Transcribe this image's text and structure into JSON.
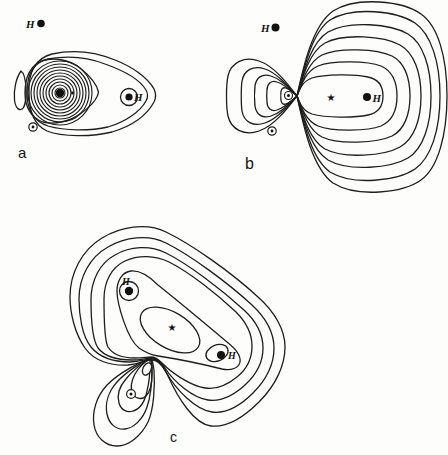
{
  "colors": {
    "background": "#fdfdfb",
    "contour_line": "#1d1d1d",
    "text": "#141414"
  },
  "panels": {
    "a": {
      "label": "a",
      "free_hydrogen_label": "H",
      "bonded_hydrogen_label": "H"
    },
    "b": {
      "label": "b",
      "free_hydrogen_label": "H",
      "bonded_hydrogen_label": "H",
      "centroid_star": "★"
    },
    "c": {
      "label": "c",
      "hydrogen_top_label": "H",
      "hydrogen_right_label": "H",
      "centroid_star": "★"
    }
  }
}
